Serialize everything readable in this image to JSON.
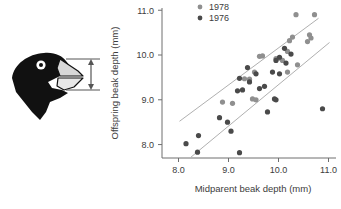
{
  "figure": {
    "illustration": {
      "name": "finch-head-profile",
      "head_color": "#111111",
      "beak_color": "#d8d8d8",
      "measure_arrow_label": "beak depth measurement arrow"
    }
  },
  "chart_data": {
    "type": "scatter",
    "title": "",
    "xlabel": "Midparent beak depth (mm)",
    "ylabel": "Offspring beak depth (mm)",
    "xlim": [
      7.75,
      11.15
    ],
    "ylim": [
      7.7,
      11.05
    ],
    "xticks": [
      "8.0",
      "9.0",
      "10.0",
      "11.0"
    ],
    "yticks": [
      "8.0",
      "9.0",
      "10.0",
      "11.0"
    ],
    "xtick_values": [
      8.0,
      9.0,
      10.0,
      11.0
    ],
    "ytick_values": [
      8.0,
      9.0,
      10.0,
      11.0
    ],
    "grid": false,
    "legend_position": "top-left",
    "colors": {
      "1978": "#8f8f8f",
      "1976": "#4a4a4a",
      "regression": "#b0b0b0",
      "axis": "#6e6e6e"
    },
    "series": [
      {
        "name": "1978",
        "color": "#8f8f8f",
        "points": [
          [
            9.62,
            9.97
          ],
          [
            9.68,
            9.98
          ],
          [
            9.32,
            9.47
          ],
          [
            9.42,
            9.46
          ],
          [
            9.52,
            9.62
          ],
          [
            9.95,
            9.92
          ],
          [
            10.02,
            9.93
          ],
          [
            10.18,
            10.08
          ],
          [
            10.22,
            10.32
          ],
          [
            10.28,
            10.4
          ],
          [
            10.35,
            10.9
          ],
          [
            10.72,
            10.9
          ],
          [
            10.62,
            10.45
          ],
          [
            10.65,
            10.38
          ],
          [
            10.58,
            10.3
          ],
          [
            10.08,
            9.88
          ],
          [
            8.88,
            8.95
          ],
          [
            9.08,
            8.92
          ],
          [
            9.48,
            9.02
          ],
          [
            9.55,
            9.0
          ],
          [
            10.38,
            9.78
          ],
          [
            10.18,
            9.62
          ]
        ]
      },
      {
        "name": "1976",
        "color": "#4a4a4a",
        "points": [
          [
            8.15,
            8.02
          ],
          [
            8.38,
            7.83
          ],
          [
            8.4,
            8.2
          ],
          [
            8.82,
            8.6
          ],
          [
            8.98,
            8.5
          ],
          [
            9.05,
            8.3
          ],
          [
            9.22,
            7.82
          ],
          [
            9.18,
            9.2
          ],
          [
            9.28,
            9.22
          ],
          [
            9.42,
            9.4
          ],
          [
            9.38,
            9.72
          ],
          [
            9.55,
            9.58
          ],
          [
            9.62,
            9.25
          ],
          [
            9.72,
            9.3
          ],
          [
            9.88,
            9.62
          ],
          [
            9.92,
            9.02
          ],
          [
            9.95,
            9.0
          ],
          [
            10.02,
            9.95
          ],
          [
            10.12,
            10.15
          ],
          [
            10.15,
            9.82
          ],
          [
            10.02,
            9.58
          ],
          [
            9.78,
            8.73
          ],
          [
            10.88,
            8.8
          ],
          [
            9.22,
            9.48
          ],
          [
            9.95,
            9.88
          ],
          [
            10.25,
            10.02
          ]
        ]
      }
    ],
    "regression_lines": [
      {
        "name": "1978-regression",
        "x1": 8.02,
        "y1": 8.52,
        "x2": 10.8,
        "y2": 10.82
      },
      {
        "name": "1976-regression",
        "x1": 8.25,
        "y1": 7.72,
        "x2": 11.02,
        "y2": 10.28
      }
    ]
  }
}
